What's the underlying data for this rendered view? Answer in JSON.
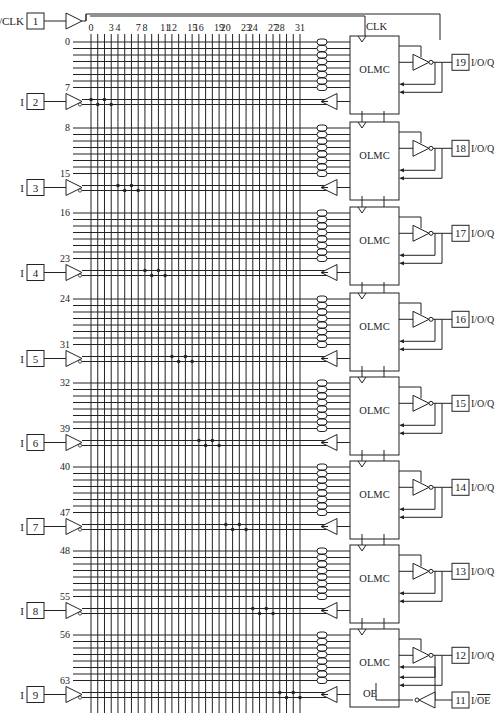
{
  "clock_pin": {
    "number": "1",
    "label": "I/CLK"
  },
  "clk_label": "CLK",
  "oe_label": "OE",
  "oe_pin": {
    "number": "11",
    "label": "I/OE"
  },
  "olmc_label": "OLMC",
  "column_labels": [
    {
      "text": "0",
      "col": 0
    },
    {
      "text": "3",
      "col": 3
    },
    {
      "text": "4",
      "col": 4
    },
    {
      "text": "7",
      "col": 7
    },
    {
      "text": "8",
      "col": 8
    },
    {
      "text": "11",
      "col": 11
    },
    {
      "text": "12",
      "col": 12
    },
    {
      "text": "15",
      "col": 15
    },
    {
      "text": "16",
      "col": 16
    },
    {
      "text": "19",
      "col": 19
    },
    {
      "text": "20",
      "col": 20
    },
    {
      "text": "23",
      "col": 23
    },
    {
      "text": "24",
      "col": 24
    },
    {
      "text": "27",
      "col": 27
    },
    {
      "text": "28",
      "col": 28
    },
    {
      "text": "31",
      "col": 31
    }
  ],
  "blocks": [
    {
      "first_row": "0",
      "last_row": "7",
      "row_y": 42,
      "input_pin": {
        "number": "2",
        "label": "I"
      },
      "io_pin": {
        "number": "19",
        "label": "I/O/Q"
      }
    },
    {
      "first_row": "8",
      "last_row": "15",
      "row_y": 128,
      "input_pin": {
        "number": "3",
        "label": "I"
      },
      "io_pin": {
        "number": "18",
        "label": "I/O/Q"
      }
    },
    {
      "first_row": "16",
      "last_row": "23",
      "row_y": 213,
      "input_pin": {
        "number": "4",
        "label": "I"
      },
      "io_pin": {
        "number": "17",
        "label": "I/O/Q"
      }
    },
    {
      "first_row": "24",
      "last_row": "31",
      "row_y": 299,
      "input_pin": {
        "number": "5",
        "label": "I"
      },
      "io_pin": {
        "number": "16",
        "label": "I/O/Q"
      }
    },
    {
      "first_row": "32",
      "last_row": "39",
      "row_y": 383,
      "input_pin": {
        "number": "6",
        "label": "I"
      },
      "io_pin": {
        "number": "15",
        "label": "I/O/Q"
      }
    },
    {
      "first_row": "40",
      "last_row": "47",
      "row_y": 467,
      "input_pin": {
        "number": "7",
        "label": "I"
      },
      "io_pin": {
        "number": "14",
        "label": "I/O/Q"
      }
    },
    {
      "first_row": "48",
      "last_row": "55",
      "row_y": 551,
      "input_pin": {
        "number": "8",
        "label": "I"
      },
      "io_pin": {
        "number": "13",
        "label": "I/O/Q"
      }
    },
    {
      "first_row": "56",
      "last_row": "63",
      "row_y": 635,
      "input_pin": {
        "number": "9",
        "label": "I"
      },
      "io_pin": {
        "number": "12",
        "label": "I/O/Q"
      }
    }
  ],
  "colors": {
    "line": "#222222",
    "background": "#ffffff"
  }
}
